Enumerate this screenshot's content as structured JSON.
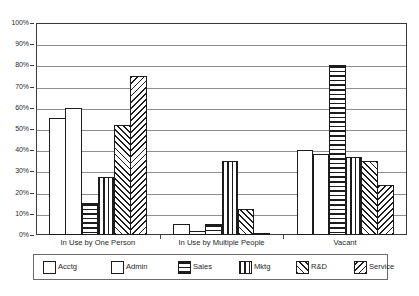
{
  "chart_data": {
    "type": "bar",
    "title": "",
    "subtitle": "",
    "xlabel": "",
    "ylabel": "",
    "ylim": [
      0,
      100
    ],
    "y_tick_labels": [
      "0%",
      "10%",
      "20%",
      "30%",
      "40%",
      "50%",
      "60%",
      "70%",
      "80%",
      "90%",
      "100%"
    ],
    "y_tick_values": [
      0,
      10,
      20,
      30,
      40,
      50,
      60,
      70,
      80,
      90,
      100
    ],
    "grid": "horizontal",
    "legend_position": "bottom",
    "categories": [
      "In Use by One Person",
      "In Use by Multiple People",
      "Vacant"
    ],
    "series": [
      {
        "name": "Acctg",
        "pattern": "dots",
        "values": [
          55,
          5,
          40
        ]
      },
      {
        "name": "Admin",
        "pattern": "blank",
        "values": [
          60,
          2,
          38
        ]
      },
      {
        "name": "Sales",
        "pattern": "horizontal-lines",
        "values": [
          15,
          5,
          80
        ]
      },
      {
        "name": "Mktg",
        "pattern": "vertical-lines",
        "values": [
          27.5,
          35,
          37
        ]
      },
      {
        "name": "R&D",
        "pattern": "diagonal-backward",
        "values": [
          52,
          12.5,
          35
        ]
      },
      {
        "name": "Service",
        "pattern": "diagonal-forward",
        "values": [
          75,
          1,
          23.5
        ]
      }
    ]
  },
  "legend": {
    "items": [
      {
        "label": "Acctg"
      },
      {
        "label": "Admin"
      },
      {
        "label": "Sales"
      },
      {
        "label": "Mktg"
      },
      {
        "label": "R&D"
      },
      {
        "label": "Service"
      }
    ]
  }
}
